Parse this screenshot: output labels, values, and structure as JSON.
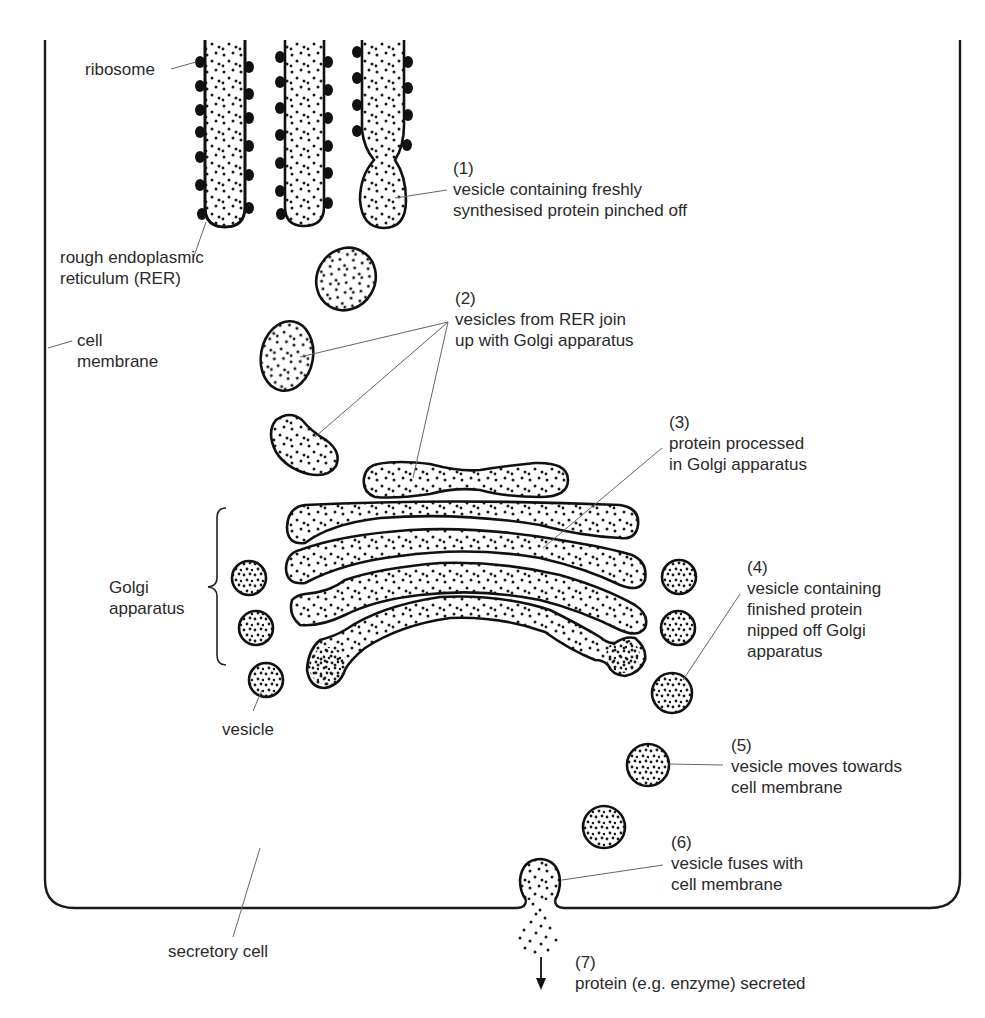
{
  "diagram": {
    "colors": {
      "stroke": "#111111",
      "leader": "#666666",
      "text": "#2a2a2a",
      "background": "#ffffff"
    }
  },
  "labels": {
    "ribosome": {
      "lines": [
        "ribosome"
      ]
    },
    "rer": {
      "lines": [
        "rough endoplasmic",
        "reticulum (RER)"
      ]
    },
    "cell_membrane": {
      "lines": [
        "cell",
        "membrane"
      ]
    },
    "golgi": {
      "lines": [
        "Golgi",
        "apparatus"
      ]
    },
    "vesicle": {
      "lines": [
        "vesicle"
      ]
    },
    "secretory_cell": {
      "lines": [
        "secretory cell"
      ]
    }
  },
  "steps": [
    {
      "number": "(1)",
      "lines": [
        "vesicle containing freshly",
        "synthesised protein pinched off"
      ]
    },
    {
      "number": "(2)",
      "lines": [
        "vesicles from RER join",
        "up with Golgi apparatus"
      ]
    },
    {
      "number": "(3)",
      "lines": [
        "protein processed",
        "in Golgi apparatus"
      ]
    },
    {
      "number": "(4)",
      "lines": [
        "vesicle containing",
        "finished protein",
        "nipped off Golgi",
        "apparatus"
      ]
    },
    {
      "number": "(5)",
      "lines": [
        "vesicle moves towards",
        "cell membrane"
      ]
    },
    {
      "number": "(6)",
      "lines": [
        "vesicle fuses with",
        "cell membrane"
      ]
    },
    {
      "number": "(7)",
      "lines": [
        "protein (e.g. enzyme) secreted"
      ]
    }
  ]
}
